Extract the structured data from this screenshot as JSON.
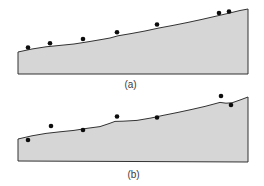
{
  "figure": {
    "width": 264,
    "height": 186,
    "background": "#ffffff"
  },
  "colors": {
    "region_fill": "#d6d6d6",
    "region_stroke": "#333333",
    "dot_fill": "#0d0d0d",
    "label_text": "#3a3a3a"
  },
  "dot_radius": 2.3,
  "stroke_width": 1,
  "chart_data": [
    {
      "type": "scatter",
      "title": "",
      "panel_label": "(a)",
      "description_visible": "shaded sloped region with points lying on its upper boundary",
      "points": [
        [
          28,
          47.5
        ],
        [
          50,
          43.2
        ],
        [
          83,
          39.0
        ],
        [
          117,
          32.2
        ],
        [
          157,
          24.5
        ],
        [
          219,
          13.0
        ],
        [
          229,
          11.5
        ]
      ]
    },
    {
      "type": "scatter",
      "title": "",
      "panel_label": "(b)",
      "description_visible": "shaded sloped region with points scattered above and below its upper boundary",
      "points": [
        [
          28,
          140.0
        ],
        [
          51,
          126.0
        ],
        [
          83,
          130.0
        ],
        [
          117,
          116.5
        ],
        [
          157,
          117.5
        ],
        [
          221,
          96.0
        ],
        [
          231,
          105.0
        ]
      ]
    }
  ],
  "panels": [
    {
      "label": "(a)",
      "label_x": 130.5,
      "label_y": 88,
      "outline": [
        [
          18,
          74
        ],
        [
          18,
          52
        ],
        [
          32,
          49
        ],
        [
          46,
          46.8
        ],
        [
          60,
          45.4
        ],
        [
          74,
          44
        ],
        [
          88,
          41.8
        ],
        [
          101,
          39.6
        ],
        [
          110,
          38
        ],
        [
          118,
          35.8
        ],
        [
          131,
          33.6
        ],
        [
          145,
          31
        ],
        [
          159,
          28
        ],
        [
          173,
          25.4
        ],
        [
          187,
          22.6
        ],
        [
          201,
          19.6
        ],
        [
          215,
          16.4
        ],
        [
          229,
          13.2
        ],
        [
          240,
          10.5
        ],
        [
          248,
          9
        ],
        [
          248,
          74
        ]
      ],
      "dots": [
        [
          28,
          47.5
        ],
        [
          50,
          43.2
        ],
        [
          83,
          39.0
        ],
        [
          117,
          32.2
        ],
        [
          157,
          24.5
        ],
        [
          219,
          13.0
        ],
        [
          229,
          11.5
        ]
      ]
    },
    {
      "label": "(b)",
      "label_x": 133.5,
      "label_y": 178,
      "outline": [
        [
          18,
          161
        ],
        [
          18,
          139
        ],
        [
          32,
          135.8
        ],
        [
          46,
          133.4
        ],
        [
          60,
          131.8
        ],
        [
          74,
          130.4
        ],
        [
          88,
          128.2
        ],
        [
          100,
          126.6
        ],
        [
          109,
          123.6
        ],
        [
          115,
          121.4
        ],
        [
          123,
          121.2
        ],
        [
          137,
          120.4
        ],
        [
          151,
          118
        ],
        [
          163,
          115.4
        ],
        [
          177,
          112.6
        ],
        [
          191,
          109.6
        ],
        [
          205,
          106.4
        ],
        [
          214,
          104
        ],
        [
          220,
          102.4
        ],
        [
          226,
          103.2
        ],
        [
          232,
          102.8
        ],
        [
          240,
          100
        ],
        [
          248,
          97
        ],
        [
          248,
          162
        ]
      ],
      "dots": [
        [
          28,
          140.0
        ],
        [
          51,
          126.0
        ],
        [
          83,
          130.0
        ],
        [
          117,
          116.5
        ],
        [
          157,
          117.5
        ],
        [
          221,
          96.0
        ],
        [
          231,
          105.0
        ]
      ]
    }
  ]
}
